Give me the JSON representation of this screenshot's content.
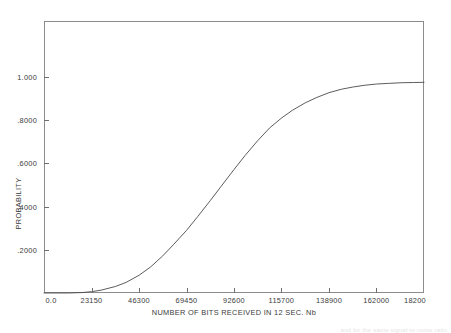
{
  "figure": {
    "background_color": "#ffffff",
    "frame_color": "#8c8c8c",
    "curve_color": "#4a4a4a",
    "text_color": "#3b3b3b"
  },
  "axes": {
    "x_title": "NUMBER OF BITS RECEIVED IN 12 SEC. Nb",
    "y_title": "PROBABILITY"
  },
  "scan_artifact": {
    "text": "and for the same signal-to-noise ratio."
  },
  "chart_data": {
    "type": "line",
    "title": "",
    "subtitle": "",
    "xlabel": "NUMBER OF BITS RECEIVED IN 12 SEC. Nb",
    "ylabel": "PROBABILITY",
    "grid": false,
    "legend": false,
    "legend_position": "none",
    "xlim": [
      0,
      185200
    ],
    "ylim": [
      0,
      1.26
    ],
    "xtick_labels": [
      "0.0",
      "23150",
      "46300",
      "69450",
      "92600",
      "115700",
      "138900",
      "162000",
      "18200"
    ],
    "xtick_values": [
      0,
      23150,
      46300,
      69450,
      92600,
      115700,
      138900,
      162000,
      185200
    ],
    "ytick_labels": [
      ".2000",
      ".4000",
      ".6000",
      ".8000",
      "1.000"
    ],
    "ytick_values": [
      0.2,
      0.4,
      0.6,
      0.8,
      1.0
    ],
    "series": [
      {
        "name": "cumulative probability",
        "x": [
          0,
          11575,
          18520,
          23150,
          27780,
          34725,
          40000,
          46300,
          52000,
          57875,
          63000,
          69450,
          75000,
          81025,
          86000,
          92600,
          98000,
          104175,
          110000,
          115700,
          121000,
          127325,
          133000,
          138900,
          145000,
          150475,
          156000,
          162000,
          168000,
          174050,
          180000,
          185200
        ],
        "y": [
          0.0,
          0.0,
          0.002,
          0.006,
          0.013,
          0.03,
          0.049,
          0.082,
          0.121,
          0.172,
          0.223,
          0.29,
          0.355,
          0.428,
          0.49,
          0.572,
          0.637,
          0.706,
          0.765,
          0.81,
          0.846,
          0.881,
          0.906,
          0.928,
          0.944,
          0.954,
          0.962,
          0.968,
          0.971,
          0.974,
          0.975,
          0.976
        ]
      }
    ]
  }
}
